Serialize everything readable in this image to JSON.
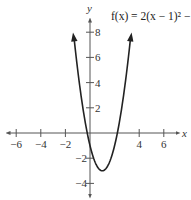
{
  "chart_data": {
    "type": "line",
    "title": "f(x) = 2(x − 1)² − 3",
    "function": "2*(x-1)^2 - 3",
    "xlabel": "x",
    "ylabel": "y",
    "xlim": [
      -7,
      7
    ],
    "ylim": [
      -5,
      9
    ],
    "x_ticks": [
      -6,
      -4,
      -2,
      4,
      6
    ],
    "y_ticks": [
      8,
      6,
      4,
      2,
      -2,
      -4
    ],
    "x_tick_labels": [
      "−6",
      "−4",
      "−2",
      "4",
      "6"
    ],
    "y_tick_labels": [
      "8",
      "6",
      "4",
      "2",
      "−2",
      "−4"
    ],
    "vertex": [
      1,
      -3
    ],
    "series": [
      {
        "name": "f(x) = 2(x − 1)² − 3",
        "x": [
          -1.3,
          -1,
          -0.5,
          0,
          0.5,
          1,
          1.5,
          2,
          2.5,
          3,
          3.3
        ],
        "y": [
          7.58,
          5,
          1.5,
          -1,
          -2.5,
          -3,
          -2.5,
          -1,
          1.5,
          5,
          7.58
        ]
      }
    ],
    "grid": false,
    "legend": null
  },
  "labels": {
    "title": "f(x) = 2(x − 1)² − 3",
    "x_axis": "x",
    "y_axis": "y"
  },
  "colors": {
    "curve": "#222222",
    "axis": "#555555",
    "text": "#333333"
  }
}
